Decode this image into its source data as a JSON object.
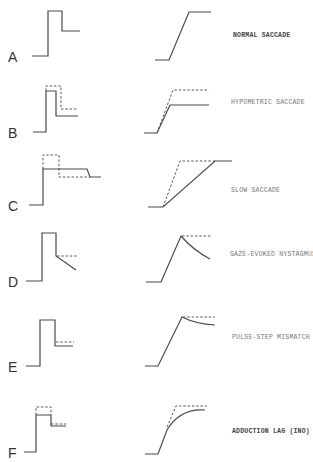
{
  "figure": {
    "legend": {
      "solid_line": "actual",
      "dashed_line": "normal / expected"
    },
    "panels": [
      {
        "letter": "A",
        "title": "NORMAL SACCADE"
      },
      {
        "letter": "B",
        "title": "HYPOMETRIC SACCADE"
      },
      {
        "letter": "C",
        "title": "SLOW SACCADE"
      },
      {
        "letter": "D",
        "title": "GAZE-EVOKED NYSTAGMUS"
      },
      {
        "letter": "E",
        "title": "PULSE-STEP MISMATCH"
      },
      {
        "letter": "F",
        "title": "ADDUCTION LAG (INO)"
      }
    ]
  }
}
